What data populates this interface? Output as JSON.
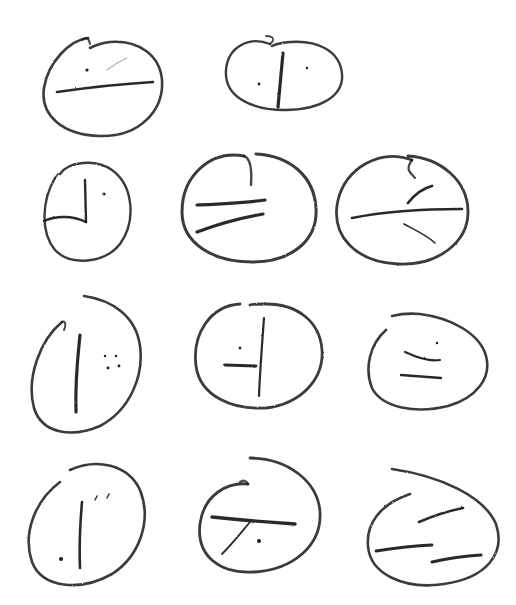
{
  "ink_color": "#1a1a1a",
  "light_ink_color": "#8a8a8a",
  "symbols": [
    {
      "id": "r1c1",
      "oval": "M 88 38 C 70 40 48 62 44 88 C 40 115 62 135 100 136 C 140 137 164 110 162 80 C 160 56 140 40 110 42 C 100 43 94 46 90 48",
      "oval_width": 2.6,
      "oval_tail": "M 82 40 C 86 36 89 38 90 44",
      "strokes": [
        {
          "d": "M 57 92 C 85 88 120 84 153 82",
          "w": 2.6,
          "light": false
        },
        {
          "d": "M 107 70 C 112 66 118 62 127 58",
          "w": 1.2,
          "light": true
        }
      ],
      "dots": [
        {
          "x": 87,
          "y": 70,
          "r": 1.6
        }
      ]
    },
    {
      "id": "r1c2",
      "oval": "M 270 44 C 250 36 228 46 226 70 C 224 96 250 110 285 110 C 320 110 344 96 342 74 C 340 50 316 40 290 42 C 280 43 275 44 272 46",
      "oval_width": 2.4,
      "oval_tail": "M 270 44 C 275 40 274 36 266 36",
      "strokes": [
        {
          "d": "M 283 53 L 278 107",
          "w": 3.2,
          "light": false
        }
      ],
      "dots": [
        {
          "x": 259,
          "y": 84,
          "r": 1.4
        },
        {
          "x": 307,
          "y": 68,
          "r": 1.2
        }
      ]
    },
    {
      "id": "r1c3",
      "empty": true
    },
    {
      "id": "r2c1",
      "oval": "M 55 178 C 42 200 40 232 55 250 C 70 266 104 264 120 244 C 136 222 134 186 112 170 C 95 158 68 162 60 174",
      "oval_width": 2.4,
      "oval_tail": "M 55 178 L 58 174",
      "strokes": [
        {
          "d": "M 85 180 L 86 222",
          "w": 2.4,
          "light": false
        },
        {
          "d": "M 44 221 C 55 216 72 215 86 222",
          "w": 2.4,
          "light": false
        }
      ],
      "dots": [
        {
          "x": 104,
          "y": 194,
          "r": 1.6
        }
      ]
    },
    {
      "id": "r2c2",
      "oval": "M 244 156 C 210 150 182 176 182 212 C 182 244 214 262 252 262 C 292 262 318 240 316 208 C 314 176 290 156 256 154",
      "oval_width": 3.0,
      "oval_tail": "M 244 156 C 250 158 252 170 251 185",
      "strokes": [
        {
          "d": "M 197 205 C 220 204 245 203 265 200",
          "w": 3.2,
          "light": false
        },
        {
          "d": "M 197 232 C 218 224 240 218 263 214",
          "w": 3.2,
          "light": false
        }
      ],
      "dots": []
    },
    {
      "id": "r2c3",
      "oval": "M 412 160 C 380 148 346 168 338 200 C 330 236 356 262 398 264 C 438 266 468 242 468 212 C 468 180 440 158 408 156",
      "oval_width": 2.8,
      "oval_tail": "M 412 160 C 405 170 410 172 415 178",
      "strokes": [
        {
          "d": "M 352 218 C 382 212 420 209 462 209",
          "w": 2.6,
          "light": false
        },
        {
          "d": "M 408 203 C 415 194 424 188 432 186",
          "w": 2.8,
          "light": false
        },
        {
          "d": "M 404 224 C 415 230 428 236 435 243",
          "w": 1.6,
          "light": false
        }
      ],
      "dots": []
    },
    {
      "id": "r3c1",
      "oval": "M 62 322 C 40 340 26 378 34 408 C 42 434 72 438 100 426 C 130 410 144 376 140 346 C 136 316 112 300 84 296",
      "oval_width": 2.6,
      "oval_tail": "M 62 322 C 66 320 66 326 64 330",
      "strokes": [
        {
          "d": "M 80 335 C 78 355 75 378 76 412",
          "w": 3.2,
          "light": false
        }
      ],
      "dots": [
        {
          "x": 105,
          "y": 356,
          "r": 1.2
        },
        {
          "x": 116,
          "y": 356,
          "r": 1.2
        },
        {
          "x": 108,
          "y": 368,
          "r": 1.4
        },
        {
          "x": 119,
          "y": 366,
          "r": 1.4
        }
      ]
    },
    {
      "id": "r3c2",
      "oval": "M 240 304 C 210 306 192 334 196 366 C 200 396 232 410 266 408 C 300 404 324 380 322 350 C 320 322 298 304 266 304 C 258 304 252 304 250 305",
      "oval_width": 2.8,
      "oval_tail": "",
      "strokes": [
        {
          "d": "M 264 318 C 262 345 260 370 259 396",
          "w": 2.2,
          "light": false
        },
        {
          "d": "M 225 365 L 256 366",
          "w": 2.8,
          "light": false
        }
      ],
      "dots": [
        {
          "x": 240,
          "y": 348,
          "r": 1.4
        }
      ]
    },
    {
      "id": "r3c3",
      "oval": "M 386 330 C 370 344 364 368 372 388 C 382 408 416 414 448 406 C 476 398 492 378 486 356 C 480 334 452 318 420 314 C 410 313 400 314 392 316",
      "oval_width": 2.6,
      "oval_tail": "",
      "strokes": [
        {
          "d": "M 405 352 C 418 358 430 362 440 360",
          "w": 2.2,
          "light": false
        },
        {
          "d": "M 401 375 C 414 376 428 377 441 378",
          "w": 2.4,
          "light": false
        }
      ],
      "dots": [
        {
          "x": 437,
          "y": 343,
          "r": 1.2
        }
      ]
    },
    {
      "id": "r4c1",
      "oval": "M 60 482 C 36 500 22 532 32 562 C 42 588 80 592 112 574 C 140 556 152 520 140 490 C 128 464 96 458 70 470",
      "oval_width": 2.6,
      "oval_tail": "",
      "strokes": [
        {
          "d": "M 82 502 C 80 525 79 545 80 568",
          "w": 2.6,
          "light": false
        },
        {
          "d": "M 95 500 L 97 496",
          "w": 1.4,
          "light": false
        },
        {
          "d": "M 107 498 L 109 494",
          "w": 1.4,
          "light": false
        }
      ],
      "dots": [
        {
          "x": 61,
          "y": 559,
          "r": 2.0
        }
      ]
    },
    {
      "id": "r4c2",
      "oval": "M 250 458 C 288 458 318 482 320 512 C 322 546 292 570 254 572 C 220 574 196 556 200 524 C 204 494 228 482 248 484",
      "oval_width": 2.8,
      "oval_tail": "M 248 484 C 246 480 243 480 240 482",
      "strokes": [
        {
          "d": "M 212 517 C 240 520 265 522 295 524",
          "w": 3.4,
          "light": false
        },
        {
          "d": "M 250 522 C 240 534 232 544 222 554",
          "w": 1.8,
          "light": false
        }
      ],
      "dots": [
        {
          "x": 259,
          "y": 541,
          "r": 2.0
        }
      ]
    },
    {
      "id": "r4c3",
      "oval": "M 392 469 C 440 476 484 496 496 524 C 506 554 486 578 444 584 C 404 590 370 574 368 546 C 366 524 380 504 410 494",
      "oval_width": 2.6,
      "oval_tail": "",
      "strokes": [
        {
          "d": "M 419 522 C 433 516 448 511 463 508",
          "w": 2.6,
          "light": false
        },
        {
          "d": "M 376 551 C 396 548 412 546 432 545",
          "w": 2.8,
          "light": false
        },
        {
          "d": "M 432 562 C 450 558 466 556 481 555",
          "w": 3.0,
          "light": false
        }
      ],
      "dots": []
    }
  ]
}
